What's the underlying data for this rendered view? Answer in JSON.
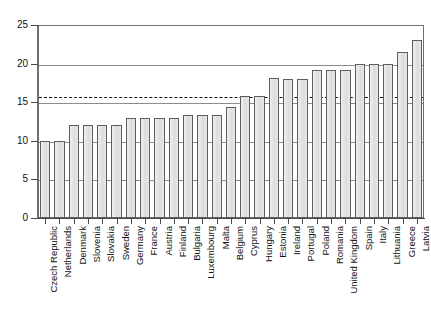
{
  "chart_data": {
    "type": "bar",
    "title": "",
    "subtitle": "",
    "xlabel": "",
    "ylabel": "",
    "ylim": [
      0,
      25
    ],
    "ytick_step": 5,
    "yticks": [
      "0",
      "5",
      "10",
      "15",
      "20",
      "25"
    ],
    "grid": "horizontal",
    "legend": "none",
    "bar_fill_color": "#e3e3e3",
    "bar_edge_color": "#5d5d5d",
    "gridline_color": "#8c8c8c",
    "frame_color": "#6f6f6f",
    "annotations": [
      {
        "name": "eu-average-line",
        "style": "dashed",
        "value": 15.8,
        "color": "#111111",
        "label": ""
      }
    ],
    "categories": [
      "Czech Republic",
      "Netherlands",
      "Denmark",
      "Slovenia",
      "Slovakia",
      "Sweden",
      "Germany",
      "France",
      "Austria",
      "Finland",
      "Bulgaria",
      "Luxembourg",
      "Malta",
      "Belgium",
      "Cyprus",
      "Hungary",
      "Estonia",
      "Ireland",
      "Portugal",
      "Poland",
      "Romania",
      "United Kingdom",
      "Spain",
      "Italy",
      "Lithuania",
      "Greece",
      "Latvia"
    ],
    "values": [
      10.0,
      10.0,
      12.0,
      12.0,
      12.0,
      12.0,
      13.0,
      13.0,
      13.0,
      13.0,
      13.3,
      13.3,
      13.3,
      14.4,
      15.8,
      15.8,
      18.2,
      18.0,
      18.0,
      19.2,
      19.2,
      19.2,
      20.0,
      20.0,
      20.0,
      21.5,
      23.0
    ]
  }
}
